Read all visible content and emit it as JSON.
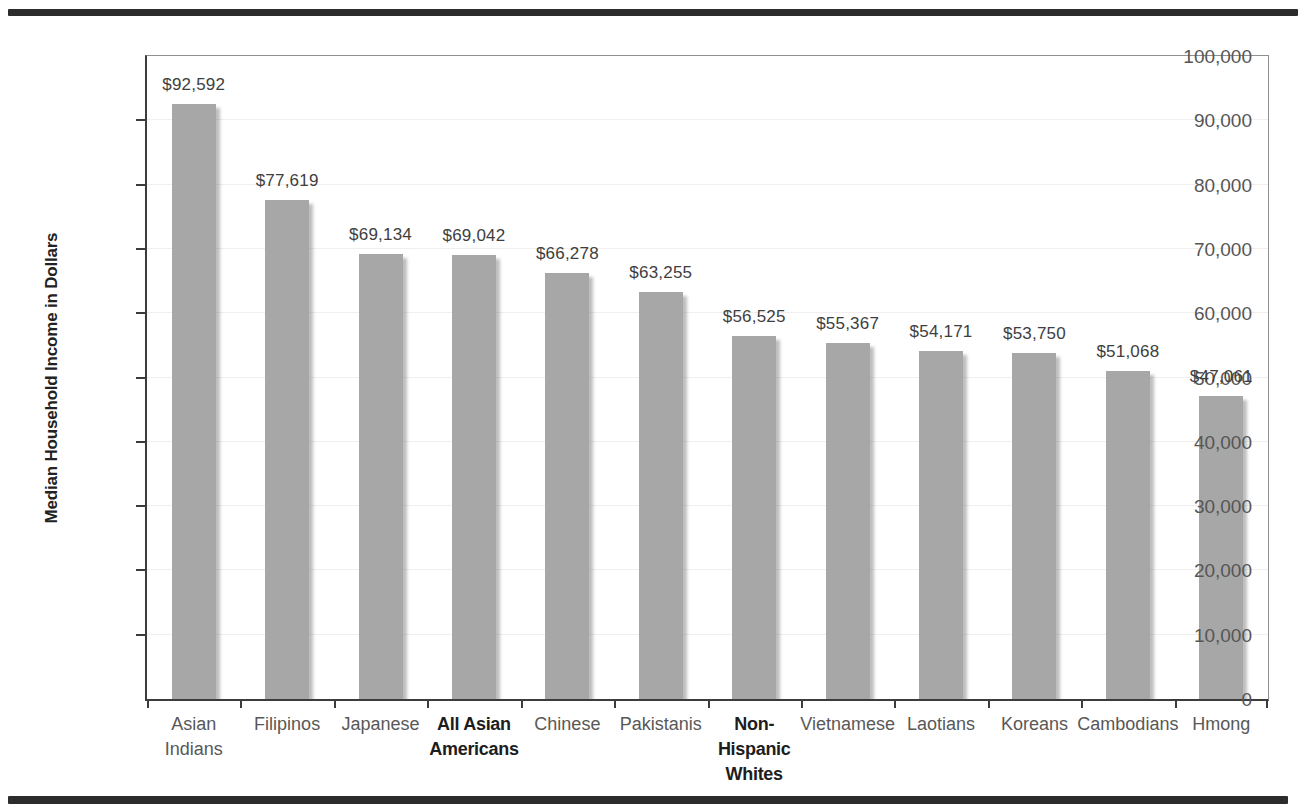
{
  "figure": {
    "background_color": "#ffffff",
    "divider_rule_color": "#2c2c2c"
  },
  "chart_data": {
    "type": "bar",
    "title": "",
    "xlabel": "",
    "ylabel": "Median Household Income in Dollars",
    "ylim": [
      0,
      100000
    ],
    "ytick_interval": 10000,
    "ytick_labels": [
      "0",
      "10,000",
      "20,000",
      "30,000",
      "40,000",
      "50,000",
      "60,000",
      "70,000",
      "80,000",
      "90,000",
      "100,000"
    ],
    "grid": "faint horizontal gridlines",
    "legend": "none",
    "bar_color": "#a7a7a7",
    "categories": [
      {
        "label": "Asian Indians",
        "lines": [
          "Asian",
          "Indians"
        ],
        "bold": false
      },
      {
        "label": "Filipinos",
        "lines": [
          "Filipinos"
        ],
        "bold": false
      },
      {
        "label": "Japanese",
        "lines": [
          "Japanese"
        ],
        "bold": false
      },
      {
        "label": "All Asian Americans",
        "lines": [
          "All Asian",
          "Americans"
        ],
        "bold": true
      },
      {
        "label": "Chinese",
        "lines": [
          "Chinese"
        ],
        "bold": false
      },
      {
        "label": "Pakistanis",
        "lines": [
          "Pakistanis"
        ],
        "bold": false
      },
      {
        "label": "Non-Hispanic Whites",
        "lines": [
          "Non-",
          "Hispanic",
          "Whites"
        ],
        "bold": true
      },
      {
        "label": "Vietnamese",
        "lines": [
          "Vietnamese"
        ],
        "bold": false
      },
      {
        "label": "Laotians",
        "lines": [
          "Laotians"
        ],
        "bold": false
      },
      {
        "label": "Koreans",
        "lines": [
          "Koreans"
        ],
        "bold": false
      },
      {
        "label": "Cambodians",
        "lines": [
          "Cambodians"
        ],
        "bold": false
      },
      {
        "label": "Hmong",
        "lines": [
          "Hmong"
        ],
        "bold": false
      }
    ],
    "values": [
      92592,
      77619,
      69134,
      69042,
      66278,
      63255,
      56525,
      55367,
      54171,
      53750,
      51068,
      47061
    ],
    "value_labels": [
      "$92,592",
      "$77,619",
      "$69,134",
      "$69,042",
      "$66,278",
      "$63,255",
      "$56,525",
      "$55,367",
      "$54,171",
      "$53,750",
      "$51,068",
      "$47,061"
    ]
  }
}
